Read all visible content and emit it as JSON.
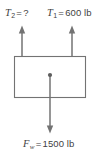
{
  "figure": {
    "name": "free-body-diagram",
    "canvas": {
      "width": 111,
      "height": 156,
      "background": "#ffffff"
    },
    "stroke_color": "#737373",
    "text_color": "#3f3f3f"
  },
  "labels": {
    "tension_two": {
      "symbol": "T",
      "subscript": "2",
      "equals": "=",
      "value": "?",
      "full": "T2 = ?"
    },
    "tension_one": {
      "symbol": "T",
      "subscript": "1",
      "equals": "=",
      "value": "600 lb",
      "full": "T1 = 600 lb"
    },
    "weight_force": {
      "symbol": "F",
      "subscript": "w",
      "equals": "=",
      "value": "1500 lb",
      "full": "Fw = 1500 lb"
    }
  },
  "body": {
    "shape": "rectangle",
    "x": 14.5,
    "y": 56.5,
    "width": 71,
    "height": 41,
    "fill": "#ffffff",
    "stroke": "#737373"
  },
  "vectors": [
    {
      "name": "tension-two-arrow",
      "direction": "up",
      "x": 22,
      "tail_y": 56,
      "head_y": 26,
      "label": "T2 = ?"
    },
    {
      "name": "tension-one-arrow",
      "direction": "up",
      "x": 72,
      "tail_y": 56,
      "head_y": 26,
      "label": "T1 = 600 lb"
    },
    {
      "name": "weight-force-arrow",
      "direction": "down",
      "x": 50,
      "tail_y": 75,
      "head_y": 133,
      "label": "Fw = 1500 lb"
    }
  ],
  "center_point": {
    "name": "center-of-gravity-dot",
    "x": 50,
    "y": 75,
    "r": 2.1
  }
}
